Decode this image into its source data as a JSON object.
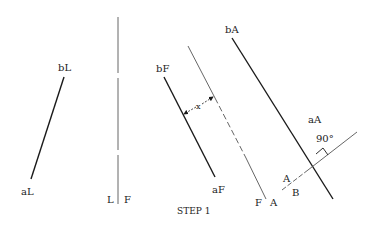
{
  "title": "STEP 1",
  "views": {
    "left": {
      "end_b": "bL",
      "end_a": "aL"
    },
    "fold_LF": {
      "left": "L",
      "right": "F"
    },
    "front": {
      "end_b": "bF",
      "end_a": "aF"
    },
    "fold_FA": {
      "left": "F",
      "right": "A"
    },
    "dimension": "x",
    "auxiliary": {
      "end_b": "bA",
      "end_a": "aA"
    },
    "fold_AB": {
      "upper": "A",
      "lower": "B"
    },
    "angle": "90°"
  },
  "colors": {
    "line": "#1a1a1a",
    "thin": "#555555"
  }
}
